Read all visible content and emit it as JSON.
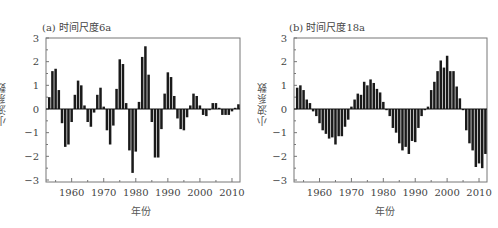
{
  "chart_data": [
    {
      "type": "bar",
      "title": "(a) 时间尺度6a",
      "xlabel": "年份",
      "ylabel": "小波系数",
      "ylim": [
        -3,
        3
      ],
      "yticks": [
        "3",
        "2",
        "1",
        "0",
        "-1",
        "-2",
        "-3"
      ],
      "xticks": [
        "1960",
        "1970",
        "1980",
        "1990",
        "2000",
        "2010"
      ],
      "x_start": 1953,
      "x": [
        1953,
        1954,
        1955,
        1956,
        1957,
        1958,
        1959,
        1960,
        1961,
        1962,
        1963,
        1964,
        1965,
        1966,
        1967,
        1968,
        1969,
        1970,
        1971,
        1972,
        1973,
        1974,
        1975,
        1976,
        1977,
        1978,
        1979,
        1980,
        1981,
        1982,
        1983,
        1984,
        1985,
        1986,
        1987,
        1988,
        1989,
        1990,
        1991,
        1992,
        1993,
        1994,
        1995,
        1996,
        1997,
        1998,
        1999,
        2000,
        2001,
        2002,
        2003,
        2004,
        2005,
        2006,
        2007,
        2008,
        2009,
        2010,
        2011,
        2012
      ],
      "values": [
        0.5,
        1.6,
        1.7,
        0.8,
        -0.6,
        -1.6,
        -1.5,
        -0.55,
        0.6,
        1.2,
        1.0,
        0.15,
        -0.55,
        -0.75,
        -0.15,
        0.6,
        0.9,
        0.1,
        -0.9,
        -1.5,
        -0.7,
        0.85,
        2.1,
        1.9,
        0.25,
        -1.75,
        -2.7,
        -1.8,
        0.3,
        2.2,
        2.65,
        1.45,
        -0.55,
        -2.05,
        -2.05,
        -0.85,
        0.65,
        1.55,
        1.35,
        0.55,
        -0.4,
        -0.85,
        -0.9,
        -0.35,
        0.15,
        0.65,
        0.55,
        0.15,
        -0.25,
        -0.3,
        -0.05,
        0.25,
        0.25,
        0.05,
        -0.25,
        -0.25,
        -0.25,
        -0.1,
        0.05,
        0.2
      ],
      "grid": false
    },
    {
      "type": "bar",
      "title": "(b) 时间尺度18a",
      "xlabel": "年份",
      "ylabel": "小波系数",
      "ylim": [
        -3,
        3
      ],
      "yticks": [
        "3",
        "2",
        "1",
        "0",
        "-1",
        "-2",
        "-3"
      ],
      "xticks": [
        "1960",
        "1970",
        "1980",
        "1990",
        "2000",
        "2010"
      ],
      "x_start": 1953,
      "x": [
        1953,
        1954,
        1955,
        1956,
        1957,
        1958,
        1959,
        1960,
        1961,
        1962,
        1963,
        1964,
        1965,
        1966,
        1967,
        1968,
        1969,
        1970,
        1971,
        1972,
        1973,
        1974,
        1975,
        1976,
        1977,
        1978,
        1979,
        1980,
        1981,
        1982,
        1983,
        1984,
        1985,
        1986,
        1987,
        1988,
        1989,
        1990,
        1991,
        1992,
        1993,
        1994,
        1995,
        1996,
        1997,
        1998,
        1999,
        2000,
        2001,
        2002,
        2003,
        2004,
        2005,
        2006,
        2007,
        2008,
        2009,
        2010,
        2011,
        2012
      ],
      "values": [
        0.9,
        1.0,
        0.8,
        0.4,
        0.25,
        -0.1,
        -0.3,
        -0.6,
        -0.9,
        -1.05,
        -1.25,
        -1.2,
        -1.5,
        -1.15,
        -1.15,
        -0.75,
        -0.45,
        0.1,
        0.4,
        0.65,
        0.6,
        1.15,
        1.0,
        1.25,
        1.1,
        0.85,
        0.7,
        0.3,
        -0.05,
        -0.3,
        -0.8,
        -1.0,
        -1.45,
        -1.75,
        -1.6,
        -1.9,
        -1.35,
        -1.4,
        -0.8,
        -0.3,
        -0.05,
        0.1,
        0.8,
        1.15,
        1.6,
        2.05,
        1.75,
        2.25,
        1.6,
        1.6,
        0.95,
        0.45,
        -0.05,
        -0.9,
        -1.45,
        -1.75,
        -2.45,
        -2.3,
        -2.5,
        -1.9,
        -1.8,
        -1.5
      ],
      "grid": false
    }
  ],
  "panels": {
    "a": {
      "title": "(a) 时间尺度6a",
      "ylabel": "小波系数",
      "xlabel": "年份"
    },
    "b": {
      "title": "(b) 时间尺度18a",
      "ylabel": "小波系数",
      "xlabel": "年份"
    }
  },
  "colors": {
    "bar": "#1a1a1a",
    "frame": "#777777",
    "tick_text": "#444444"
  }
}
